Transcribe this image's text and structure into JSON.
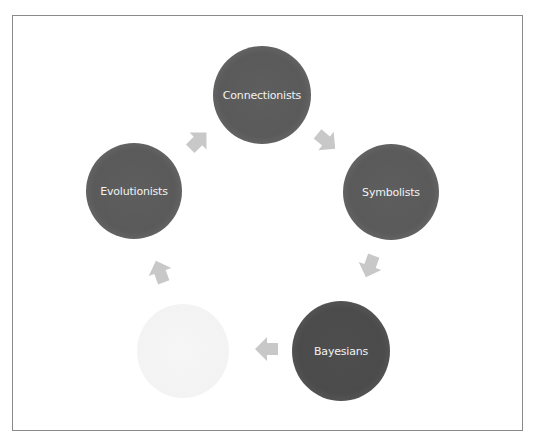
{
  "diagram": {
    "type": "cycle",
    "nodes": [
      {
        "id": "connectionists",
        "label": "Connectionists",
        "style": "dark"
      },
      {
        "id": "symbolists",
        "label": "Symbolists",
        "style": "dark"
      },
      {
        "id": "bayesians",
        "label": "Bayesians",
        "style": "darker"
      },
      {
        "id": "unlabeled",
        "label": "",
        "style": "faded"
      },
      {
        "id": "evolutionists",
        "label": "Evolutionists",
        "style": "dark"
      }
    ],
    "edges": [
      {
        "from": "evolutionists",
        "to": "connectionists"
      },
      {
        "from": "connectionists",
        "to": "symbolists"
      },
      {
        "from": "symbolists",
        "to": "bayesians"
      },
      {
        "from": "bayesians",
        "to": "unlabeled"
      },
      {
        "from": "unlabeled",
        "to": "evolutionists"
      }
    ],
    "colors": {
      "node_dark": "#5a5a5a",
      "node_darker": "#4b4b4b",
      "node_faded": "#f3f3f3",
      "arrow": "#c8c8c8",
      "frame_border": "#8a8a8a",
      "label_text": "#f2f2f2"
    }
  }
}
